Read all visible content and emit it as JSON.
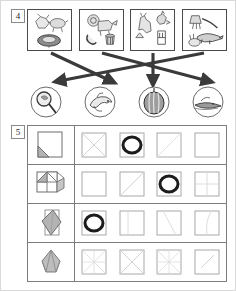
{
  "page": {
    "background_color": "#ffffff",
    "border_color": "#d9d9d9",
    "width": 236,
    "height": 291
  },
  "exercise_4": {
    "number": "4",
    "type": "matching-with-arrows",
    "top_row": {
      "label": "picture-boxes",
      "items": [
        {
          "id": 1,
          "icon": "animals-and-nest-icon",
          "description": "animals around a round nest"
        },
        {
          "id": 2,
          "icon": "lion-and-objects-icon",
          "description": "lion with horn and basket"
        },
        {
          "id": 3,
          "icon": "kangaroo-bird-chair-icon",
          "description": "kangaroo, bird and chair"
        },
        {
          "id": 4,
          "icon": "broom-crocodile-rabbit-icon",
          "description": "broom, crocodile and rabbit"
        }
      ]
    },
    "bottom_row": {
      "label": "answer-circles",
      "items": [
        {
          "id": 1,
          "icon": "magnifying-glass-icon",
          "description": "magnifying glass over object"
        },
        {
          "id": 2,
          "icon": "dolphin-icon",
          "description": "dolphin"
        },
        {
          "id": 3,
          "icon": "pumpkin-icon",
          "description": "striped pumpkin"
        },
        {
          "id": 4,
          "icon": "crocodile-icon",
          "description": "crocodile in water"
        }
      ]
    },
    "connections": [
      {
        "from_box": 1,
        "to_circle": 2
      },
      {
        "from_box": 2,
        "to_circle": 4
      },
      {
        "from_box": 3,
        "to_circle": 3
      },
      {
        "from_box": 4,
        "to_circle": 1
      }
    ],
    "arrow_color": "#3a3a3a"
  },
  "exercise_5": {
    "number": "5",
    "type": "paper-folding-grid",
    "selection_marker": "circle",
    "selection_color": "#1c1c1c",
    "rows": [
      {
        "id": 1,
        "prompt": {
          "icon": "folded-square-corner-icon",
          "description": "square with bottom-left corner folded"
        },
        "options": [
          {
            "id": 1,
            "icon": "x-crease-square-icon",
            "selected": false
          },
          {
            "id": 2,
            "icon": "blank-square-icon",
            "selected": true
          },
          {
            "id": 3,
            "icon": "diagonal-crease-square-icon",
            "selected": false
          },
          {
            "id": 4,
            "icon": "blank-square-icon",
            "selected": false
          }
        ]
      },
      {
        "id": 2,
        "prompt": {
          "icon": "folded-quarters-icon",
          "description": "square folded into quarters with shaded triangle"
        },
        "options": [
          {
            "id": 1,
            "icon": "blank-square-icon",
            "selected": false
          },
          {
            "id": 2,
            "icon": "diagonal-crease-square-icon",
            "selected": false
          },
          {
            "id": 3,
            "icon": "blank-square-icon",
            "selected": true
          },
          {
            "id": 4,
            "icon": "cross-crease-square-icon",
            "selected": false
          }
        ]
      },
      {
        "id": 3,
        "prompt": {
          "icon": "folded-kite-icon",
          "description": "kite shaped fold shaded grey"
        },
        "options": [
          {
            "id": 1,
            "icon": "blank-square-icon",
            "selected": true
          },
          {
            "id": 2,
            "icon": "vertical-crease-square-icon",
            "selected": false
          },
          {
            "id": 3,
            "icon": "diagonal-crease-square-icon",
            "selected": false
          },
          {
            "id": 4,
            "icon": "slanted-crease-square-icon",
            "selected": false
          }
        ]
      },
      {
        "id": 4,
        "prompt": {
          "icon": "folded-tulip-icon",
          "description": "tulip fan fold shaded grey"
        },
        "options": [
          {
            "id": 1,
            "icon": "star-crease-square-icon",
            "selected": false
          },
          {
            "id": 2,
            "icon": "x-crease-square-icon",
            "selected": false
          },
          {
            "id": 3,
            "icon": "star-crease-square-icon",
            "selected": false
          },
          {
            "id": 4,
            "icon": "diagonal-crease-square-icon",
            "selected": true
          }
        ]
      }
    ]
  }
}
